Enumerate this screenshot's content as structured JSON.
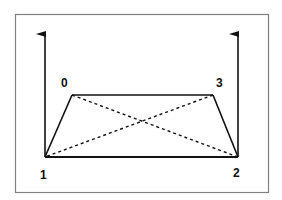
{
  "diagram": {
    "type": "trapezoid with diagonals and vertical arrows",
    "frame": {
      "x": 15,
      "y": 14,
      "width": 253,
      "height": 178,
      "stroke": "#808080"
    },
    "points": [
      {
        "id": "0",
        "label": "0",
        "x": 72,
        "y": 95,
        "label_x": 61,
        "label_y": 87
      },
      {
        "id": "1",
        "label": "1",
        "x": 45,
        "y": 157,
        "label_x": 40,
        "label_y": 179
      },
      {
        "id": "2",
        "label": "2",
        "x": 238,
        "y": 157,
        "label_x": 233,
        "label_y": 177
      },
      {
        "id": "3",
        "label": "3",
        "x": 213,
        "y": 95,
        "label_x": 216,
        "label_y": 87
      }
    ],
    "solid_edges": [
      [
        "1",
        "0"
      ],
      [
        "0",
        "3"
      ],
      [
        "3",
        "2"
      ],
      [
        "1",
        "2"
      ]
    ],
    "dashed_edges": [
      [
        "0",
        "2"
      ],
      [
        "3",
        "1"
      ],
      [
        "1",
        "0"
      ]
    ],
    "arrows": [
      {
        "name": "left-vertical-arrow",
        "x": 45,
        "y_from": 157,
        "y_to": 33
      },
      {
        "name": "right-vertical-arrow",
        "x": 238,
        "y_from": 157,
        "y_to": 33
      }
    ],
    "colors": {
      "line": "#111111",
      "frame": "#808080"
    }
  }
}
